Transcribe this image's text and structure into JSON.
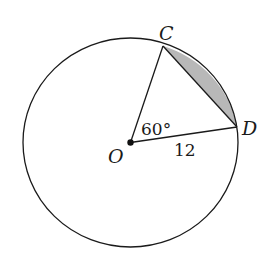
{
  "diagram": {
    "circle": {
      "center_label": "O",
      "cx": 130.5,
      "cy": 142.5,
      "rx": 107.5,
      "ry": 104.5
    },
    "points": {
      "O": {
        "label": "O",
        "x": 130.5,
        "y": 142.5
      },
      "C": {
        "label": "C",
        "x": 163,
        "y": 46
      },
      "D": {
        "label": "D",
        "x": 237,
        "y": 127
      }
    },
    "angle_label": "60°",
    "radius_label": "12",
    "shaded_region": "segment between chord CD and arc CD",
    "colors": {
      "stroke": "#1a1a1a",
      "shade": "#b8b8b8"
    }
  }
}
